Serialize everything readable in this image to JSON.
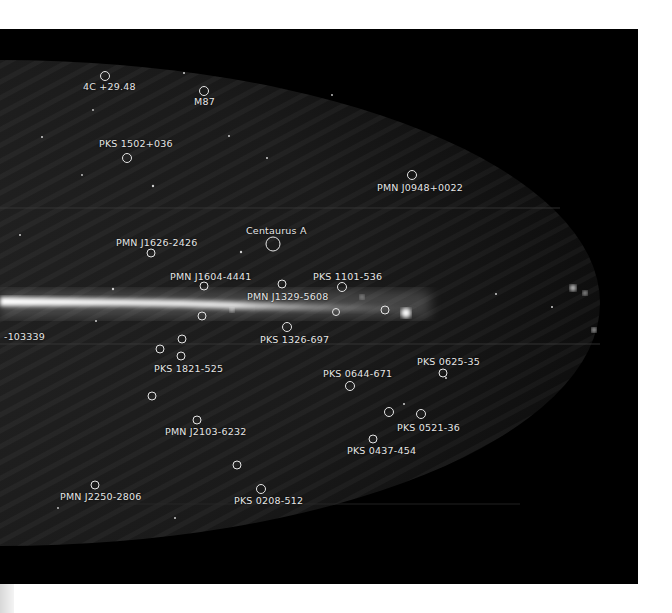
{
  "figure": {
    "type": "all-sky map",
    "background": "#000000",
    "sky_fill": "#1c1c1c",
    "plane_color": "#f2f2f2",
    "marker_color": "#e6e6e6"
  },
  "sources": [
    {
      "name": "4C +29.48",
      "cx": 105,
      "cy": 76,
      "r": 4.5,
      "lx": 83,
      "ly": 81
    },
    {
      "name": "M87",
      "cx": 204,
      "cy": 91,
      "r": 4.5,
      "lx": 194,
      "ly": 96
    },
    {
      "name": "PKS 1502+036",
      "cx": 127,
      "cy": 158,
      "r": 4.5,
      "lx": 99,
      "ly": 138
    },
    {
      "name": "PMN J0948+0022",
      "cx": 412,
      "cy": 175,
      "r": 4.5,
      "lx": 377,
      "ly": 182
    },
    {
      "name": "Centaurus A",
      "cx": 273,
      "cy": 244,
      "r": 7,
      "lx": 246,
      "ly": 225
    },
    {
      "name": "PMN J1626-2426",
      "cx": 151,
      "cy": 253,
      "r": 4,
      "lx": 116,
      "ly": 237
    },
    {
      "name": "PMN J1604-4441",
      "cx": 204,
      "cy": 286,
      "r": 4,
      "lx": 170,
      "ly": 271
    },
    {
      "name": "PKS 1101-536",
      "cx": 342,
      "cy": 287,
      "r": 4.5,
      "lx": 313,
      "ly": 271
    },
    {
      "name": "PMN J1329-5608",
      "cx": 282,
      "cy": 284,
      "r": 4,
      "lx": 247,
      "ly": 291
    },
    {
      "name": "PKS 1326-697",
      "cx": 287,
      "cy": 327,
      "r": 4.5,
      "lx": 260,
      "ly": 334
    },
    {
      "name": "PKS 1821-525",
      "cx": 181,
      "cy": 356,
      "r": 4,
      "lx": 154,
      "ly": 363
    },
    {
      "name": "PKS 0644-671",
      "cx": 350,
      "cy": 386,
      "r": 4.5,
      "lx": 323,
      "ly": 368
    },
    {
      "name": "PKS 0625-35",
      "cx": 443,
      "cy": 373,
      "r": 4,
      "lx": 417,
      "ly": 356
    },
    {
      "name": "PKS 0521-36",
      "cx": 421,
      "cy": 414,
      "r": 4.5,
      "lx": 397,
      "ly": 422
    },
    {
      "name": "PKS 0437-454",
      "cx": 373,
      "cy": 439,
      "r": 4,
      "lx": 347,
      "ly": 445
    },
    {
      "name": "PMN J2103-6232",
      "cx": 197,
      "cy": 420,
      "r": 4,
      "lx": 165,
      "ly": 426
    },
    {
      "name": "PMN J2250-2806",
      "cx": 95,
      "cy": 485,
      "r": 4,
      "lx": 60,
      "ly": 491
    },
    {
      "name": "PKS 0208-512",
      "cx": 261,
      "cy": 489,
      "r": 4.5,
      "lx": 234,
      "ly": 495
    },
    {
      "name": "-103339",
      "cx": null,
      "cy": null,
      "r": 0,
      "lx": 4,
      "ly": 331
    }
  ],
  "unlabeled_markers": [
    {
      "cx": 202,
      "cy": 316,
      "r": 4
    },
    {
      "cx": 182,
      "cy": 339,
      "r": 4
    },
    {
      "cx": 160,
      "cy": 349,
      "r": 4
    },
    {
      "cx": 152,
      "cy": 396,
      "r": 4
    },
    {
      "cx": 237,
      "cy": 465,
      "r": 4
    },
    {
      "cx": 336,
      "cy": 312,
      "r": 3.5
    },
    {
      "cx": 385,
      "cy": 310,
      "r": 4
    },
    {
      "cx": 389,
      "cy": 412,
      "r": 4.5
    }
  ],
  "labels": {
    "l0": "4C +29.48",
    "l1": "M87",
    "l2": "PKS 1502+036",
    "l3": "PMN J0948+0022",
    "l4": "Centaurus A",
    "l5": "PMN J1626-2426",
    "l6": "PMN J1604-4441",
    "l7": "PKS 1101-536",
    "l8": "PMN J1329-5608",
    "l9": "PKS 1326-697",
    "l10": "PKS 1821-525",
    "l11": "PKS 0644-671",
    "l12": "PKS 0625-35",
    "l13": "PKS 0521-36",
    "l14": "PKS 0437-454",
    "l15": "PMN J2103-6232",
    "l16": "PMN J2250-2806",
    "l17": "PKS 0208-512",
    "l18": "-103339"
  }
}
